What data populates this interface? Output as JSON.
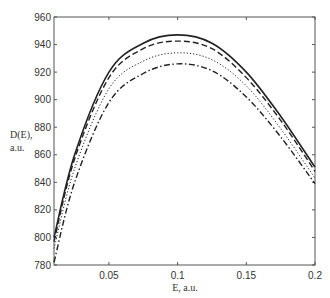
{
  "chart_data": {
    "type": "line",
    "title": "",
    "xlabel": "E, a.u.",
    "ylabel": "D(E),",
    "ylabel_unit": "a.u.",
    "xlim": [
      0.01,
      0.2
    ],
    "ylim": [
      780,
      960
    ],
    "xticks": [
      0.05,
      0.1,
      0.15,
      0.2
    ],
    "xtick_labels": [
      "0.05",
      "0.1",
      "0.15",
      "0.2"
    ],
    "yticks": [
      780,
      800,
      820,
      840,
      860,
      880,
      900,
      920,
      940,
      960
    ],
    "ytick_labels": [
      "780",
      "800",
      "820",
      "840",
      "860",
      "880",
      "900",
      "920",
      "940",
      "960"
    ],
    "grid": false,
    "legend": "none",
    "x": [
      0.01,
      0.025,
      0.05,
      0.075,
      0.1,
      0.125,
      0.15,
      0.175,
      0.2
    ],
    "series": [
      {
        "name": "solid",
        "style": "solid",
        "values": [
          800,
          860,
          920,
          941,
          947,
          941,
          920,
          888,
          851
        ]
      },
      {
        "name": "dashed",
        "style": "dashed",
        "values": [
          797,
          857,
          916,
          937,
          942.5,
          937,
          916,
          885,
          848
        ]
      },
      {
        "name": "dotted",
        "style": "dotted",
        "values": [
          792,
          850,
          908,
          928,
          934,
          929,
          910,
          879,
          843
        ]
      },
      {
        "name": "dash-dot",
        "style": "dash-dot",
        "values": [
          782,
          840,
          898,
          919,
          926,
          921,
          902,
          873,
          839
        ]
      }
    ]
  }
}
